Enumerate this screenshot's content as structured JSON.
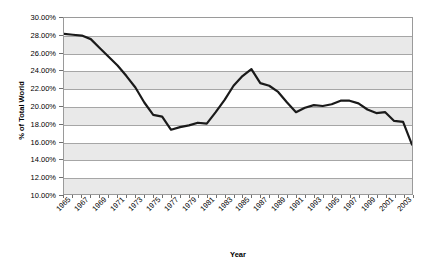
{
  "chart_data": {
    "type": "line",
    "title": "",
    "xlabel": "Year",
    "ylabel": "% of Total World",
    "ylim": [
      10,
      30
    ],
    "ytick_step": 2,
    "ytick_labels": [
      "30.00%",
      "28.00%",
      "26.00%",
      "24.00%",
      "22.00%",
      "20.00%",
      "18.00%",
      "16.00%",
      "14.00%",
      "12.00%",
      "10.00%"
    ],
    "xlim": [
      1965,
      2004
    ],
    "xtick_labels": [
      "1965",
      "1967",
      "1969",
      "1971",
      "1973",
      "1975",
      "1977",
      "1979",
      "1981",
      "1983",
      "1985",
      "1987",
      "1989",
      "1991",
      "1993",
      "1995",
      "1997",
      "1999",
      "2001",
      "2003"
    ],
    "grid": true,
    "legend": "none",
    "line_color": "#1a1a1a",
    "plot_background": "#ffffff",
    "band_color": "#e9e9e9",
    "gridline_color": "#a6a6a6",
    "x": [
      1965,
      1966,
      1967,
      1968,
      1969,
      1970,
      1971,
      1972,
      1973,
      1974,
      1975,
      1976,
      1977,
      1978,
      1979,
      1980,
      1981,
      1982,
      1983,
      1984,
      1985,
      1986,
      1987,
      1988,
      1989,
      1990,
      1991,
      1992,
      1993,
      1994,
      1995,
      1996,
      1997,
      1998,
      1999,
      2000,
      2001,
      2002,
      2003,
      2004
    ],
    "values": [
      28.2,
      28.1,
      28.0,
      27.6,
      26.6,
      25.6,
      24.6,
      23.4,
      22.1,
      20.4,
      19.0,
      18.8,
      17.3,
      17.6,
      17.8,
      18.1,
      18.0,
      19.3,
      20.7,
      22.3,
      23.4,
      24.2,
      22.6,
      22.3,
      21.6,
      20.4,
      19.3,
      19.8,
      20.1,
      20.0,
      20.2,
      20.6,
      20.6,
      20.3,
      19.6,
      19.2,
      19.3,
      18.3,
      18.2,
      15.6
    ],
    "series_name": "% of Total World"
  },
  "axis": {
    "y_title": "% of Total World",
    "x_title": "Year"
  }
}
